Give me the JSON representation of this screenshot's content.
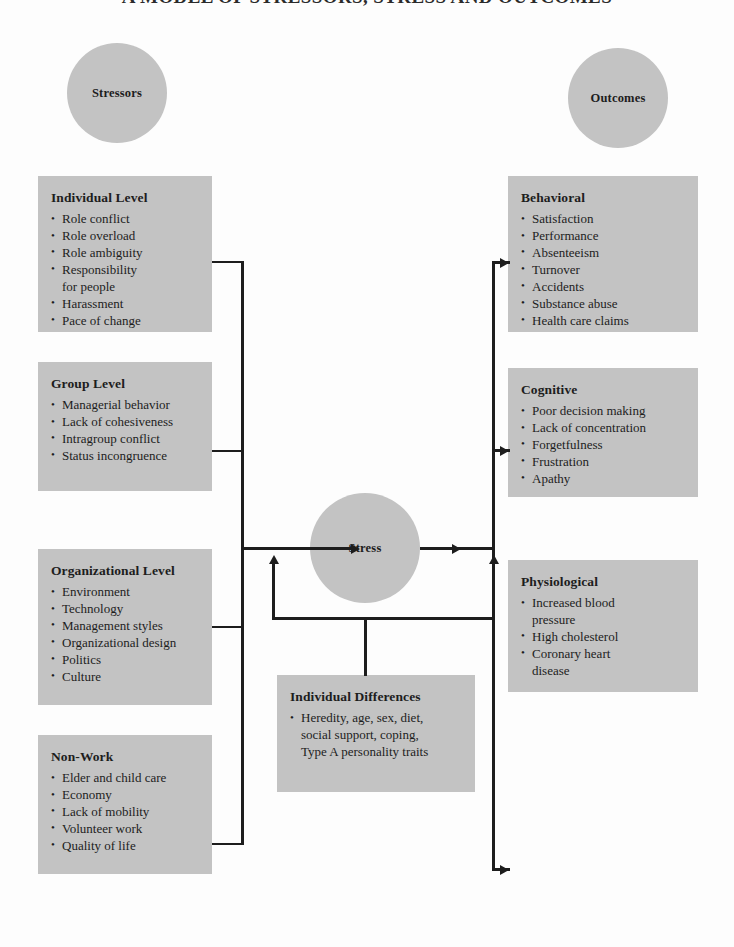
{
  "figure": {
    "title": "A MODEL OF STRESSORS, STRESS AND OUTCOMES"
  },
  "colors": {
    "node_fill": "#c3c3c3",
    "line": "#1d1d1d",
    "text": "#1d1d1d",
    "background": "#fdfdfd"
  },
  "headers": {
    "stressors": "Stressors",
    "outcomes": "Outcomes"
  },
  "center": {
    "stress": "Stress",
    "moderator": {
      "title": "Individual Differences",
      "items": [
        "Heredity, age, sex, diet,\nsocial support, coping,\nType A personality traits"
      ]
    }
  },
  "stressor_boxes": [
    {
      "title": "Individual Level",
      "items": [
        "Role conflict",
        "Role overload",
        "Role ambiguity",
        "Responsibility\nfor people",
        "Harassment",
        "Pace of change"
      ]
    },
    {
      "title": "Group Level",
      "items": [
        "Managerial behavior",
        "Lack of cohesiveness",
        "Intragroup conflict",
        "Status incongruence"
      ]
    },
    {
      "title": "Organizational Level",
      "items": [
        "Environment",
        "Technology",
        "Management styles",
        "Organizational design",
        "Politics",
        "Culture"
      ]
    },
    {
      "title": "Non-Work",
      "items": [
        "Elder and child care",
        "Economy",
        "Lack of mobility",
        "Volunteer work",
        "Quality of life"
      ]
    }
  ],
  "outcome_boxes": [
    {
      "title": "Behavioral",
      "items": [
        "Satisfaction",
        "Performance",
        "Absenteeism",
        "Turnover",
        "Accidents",
        "Substance abuse",
        "Health care claims"
      ]
    },
    {
      "title": "Cognitive",
      "items": [
        "Poor decision making",
        "Lack of concentration",
        "Forgetfulness",
        "Frustration",
        "Apathy"
      ]
    },
    {
      "title": "Physiological",
      "items": [
        "Increased blood\npressure",
        "High cholesterol",
        "Coronary heart\ndisease"
      ]
    }
  ]
}
